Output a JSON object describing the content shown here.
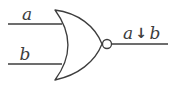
{
  "diagram": {
    "kind": "logic-gate-schematic",
    "gate_type": "NOR",
    "stroke_color": "#3d3d3d",
    "background_color": "#ffffff",
    "inputs": {
      "top": {
        "label": "a"
      },
      "bottom": {
        "label": "b"
      }
    },
    "output": {
      "expression": "a ↓ b",
      "var1": "a",
      "operator": "↓",
      "var2": "b"
    }
  }
}
